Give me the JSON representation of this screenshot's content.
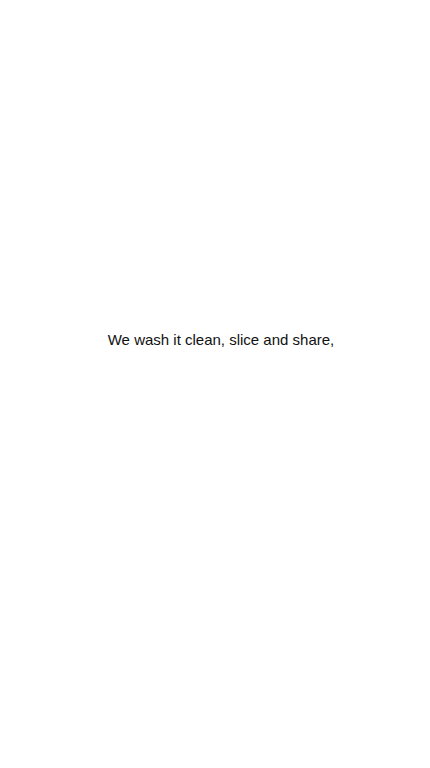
{
  "screen": {
    "background_color": "#ffffff",
    "text_color": "#111111"
  },
  "content": {
    "line": "We wash it clean, slice and share,"
  }
}
